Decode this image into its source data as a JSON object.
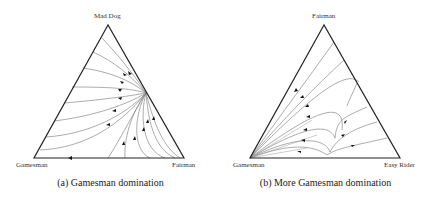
{
  "figure": {
    "panels": [
      {
        "id": "a",
        "caption": "(a) Gamesman domination",
        "vertices": {
          "top": "Mad Dog",
          "bottom_left": "Gamesman",
          "bottom_right": "Fairman"
        },
        "description": "Ternary phase portrait; trajectories converge to a point on the Mad Dog–Fairman edge, then flow toward Gamesman along the bottom edge."
      },
      {
        "id": "b",
        "caption": "(b) More Gamesman domination",
        "vertices": {
          "top": "Fairman",
          "bottom_left": "Gamesman",
          "bottom_right": "Easy Rider"
        },
        "description": "Ternary phase portrait; all trajectories flow toward the Gamesman vertex."
      }
    ],
    "colors": {
      "edge": "#222222",
      "trajectory": "#888888",
      "arrow": "#111111"
    }
  }
}
